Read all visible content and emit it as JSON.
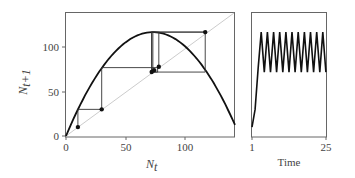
{
  "chart_data": [
    {
      "type": "line",
      "title": "Cobweb plot",
      "xlabel": "N_t",
      "ylabel": "N_{t+1}",
      "xlim": [
        0,
        142
      ],
      "ylim": [
        0,
        137
      ],
      "xticks": [
        "0",
        "50",
        "100"
      ],
      "yticks": [
        "0",
        "50",
        "100"
      ],
      "series": [
        {
          "name": "recruitment curve",
          "note": "parabola peaking ~117 at N_t ~73, through origin"
        },
        {
          "name": "1:1 line",
          "x": [
            0,
            142
          ],
          "y": [
            0,
            142
          ]
        },
        {
          "name": "iterates",
          "x": [
            10,
            30,
            77,
            73,
            117,
            72,
            117
          ],
          "y": [
            10,
            30,
            77,
            72,
            117,
            72,
            117
          ]
        }
      ],
      "grid": false
    },
    {
      "type": "line",
      "title": "Time series",
      "xlabel": "Time",
      "xticks": [
        "1",
        "25"
      ],
      "series": [
        {
          "name": "N",
          "x": [
            1,
            2,
            3,
            4,
            5,
            6,
            7,
            8,
            9,
            10,
            11,
            12,
            13,
            14,
            15,
            16,
            17,
            18,
            19,
            20,
            21,
            22,
            23,
            24,
            25
          ],
          "y": [
            10,
            30,
            77,
            117,
            72,
            117,
            72,
            117,
            72,
            117,
            72,
            117,
            72,
            117,
            72,
            117,
            72,
            117,
            72,
            117,
            72,
            117,
            72,
            117,
            72
          ]
        }
      ]
    }
  ],
  "labels": {
    "x_left": "N",
    "x_left_sub": "t",
    "y_left": "N",
    "y_left_sub": "t+1",
    "x_right": "Time",
    "xt0": "0",
    "xt1": "50",
    "xt2": "100",
    "yt0": "0",
    "yt1": "50",
    "yt2": "100",
    "rt0": "1",
    "rt1": "25"
  }
}
